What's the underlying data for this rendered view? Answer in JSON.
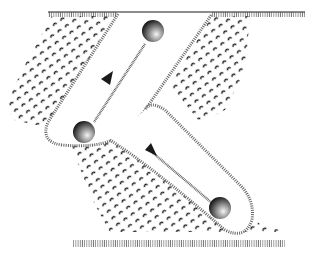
{
  "diagram": {
    "kind": "top-down line drawing of a two-lane chute with ball and flag markers",
    "colors": {
      "background": "#ffffff",
      "ink": "#1a1a1a",
      "hatch": "#555555",
      "ball_light": "#f4f4f4",
      "ball_dark": "#111111"
    },
    "elements": [
      {
        "name": "top-ground-line",
        "type": "hatched-line"
      },
      {
        "name": "bottom-ground-line",
        "type": "hatched-line"
      },
      {
        "name": "upper-lane",
        "type": "rounded-channel"
      },
      {
        "name": "lower-lane",
        "type": "rounded-channel"
      },
      {
        "name": "ball-top",
        "type": "sphere"
      },
      {
        "name": "ball-middle",
        "type": "sphere"
      },
      {
        "name": "ball-bottom",
        "type": "sphere"
      },
      {
        "name": "flag-upper",
        "type": "triangle-marker"
      },
      {
        "name": "flag-lower",
        "type": "triangle-marker"
      },
      {
        "name": "dotted-terrain",
        "type": "pebble-texture"
      }
    ]
  }
}
